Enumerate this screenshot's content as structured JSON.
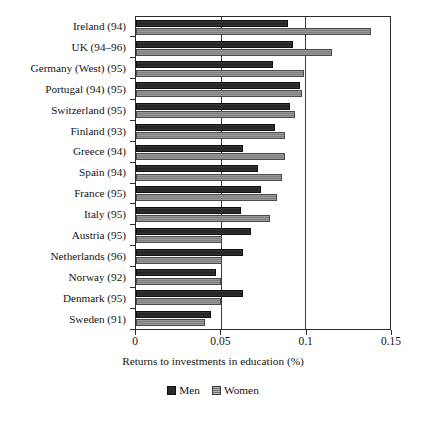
{
  "chart_data": {
    "type": "bar",
    "orientation": "horizontal",
    "title": "",
    "xlabel": "Returns to investments in education (%)",
    "ylabel": "",
    "xlim": [
      0,
      0.15
    ],
    "xticks": [
      0,
      0.05,
      0.1,
      0.15
    ],
    "xtick_labels": [
      "0",
      "0.05",
      "0.1",
      "0.15"
    ],
    "grid": "vertical",
    "legend_position": "bottom",
    "categories": [
      "Ireland (94)",
      "UK (94–96)",
      "Germany (West) (95)",
      "Portugal (94) (95)",
      "Switzerland (95)",
      "Finland (93)",
      "Greece (94)",
      "Spain (94)",
      "France (95)",
      "Italy (95)",
      "Austria (95)",
      "Netherlands (96)",
      "Norway (92)",
      "Denmark (95)",
      "Sweden (91)"
    ],
    "series": [
      {
        "name": "Men",
        "color": "#2b2b2b",
        "values": [
          0.09,
          0.093,
          0.081,
          0.097,
          0.091,
          0.082,
          0.063,
          0.072,
          0.074,
          0.062,
          0.068,
          0.063,
          0.047,
          0.063,
          0.044
        ]
      },
      {
        "name": "Women",
        "color": "#8e8e8e",
        "values": [
          0.139,
          0.116,
          0.099,
          0.098,
          0.094,
          0.088,
          0.088,
          0.086,
          0.083,
          0.079,
          0.051,
          0.051,
          0.05,
          0.05,
          0.041
        ]
      }
    ]
  },
  "legend": {
    "entries": [
      {
        "label": "Men"
      },
      {
        "label": "Women"
      }
    ]
  }
}
